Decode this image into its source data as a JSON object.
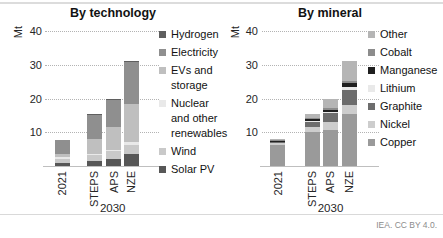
{
  "figure": {
    "attribution": "IEA. CC BY 4.0."
  },
  "chart_data": [
    {
      "type": "bar",
      "stacked": true,
      "title": "By technology",
      "ylabel": "Mt",
      "categories": [
        "2021",
        "STEPS",
        "APS",
        "NZE"
      ],
      "group_label": "2030",
      "ylim": [
        0,
        40
      ],
      "yticks": [
        10,
        20,
        30,
        40
      ],
      "grid": "horizontal-dotted",
      "legend_position": "right",
      "legend_order_top_to_bottom": [
        "Hydrogen",
        "Electricity",
        "EVs and storage",
        "Nuclear and other renewables",
        "Wind",
        "Solar PV"
      ],
      "series": [
        {
          "name": "Solar PV",
          "color": "#575757",
          "values": [
            1.0,
            1.6,
            2.0,
            3.5
          ]
        },
        {
          "name": "Wind",
          "color": "#c9c9c9",
          "values": [
            1.2,
            1.6,
            2.3,
            2.8
          ]
        },
        {
          "name": "Nuclear and other renewables",
          "color": "#e9e9e9",
          "values": [
            0.4,
            0.5,
            0.5,
            0.7
          ]
        },
        {
          "name": "EVs and storage",
          "color": "#bfbfbf",
          "values": [
            1.0,
            4.3,
            6.7,
            11.5
          ]
        },
        {
          "name": "Electricity",
          "color": "#8f8f8f",
          "values": [
            4.2,
            7.4,
            8.3,
            12.2
          ]
        },
        {
          "name": "Hydrogen",
          "color": "#5f5f5f",
          "values": [
            0.0,
            0.1,
            0.2,
            0.3
          ]
        }
      ],
      "totals": [
        7.8,
        15.5,
        20.0,
        31.0
      ]
    },
    {
      "type": "bar",
      "stacked": true,
      "title": "By mineral",
      "ylabel": "Mt",
      "categories": [
        "2021",
        "STEPS",
        "APS",
        "NZE"
      ],
      "group_label": "2030",
      "ylim": [
        0,
        40
      ],
      "yticks": [
        10,
        20,
        30,
        40
      ],
      "grid": "horizontal-dotted",
      "legend_position": "right",
      "legend_order_top_to_bottom": [
        "Other",
        "Cobalt",
        "Manganese",
        "Lithium",
        "Graphite",
        "Nickel",
        "Copper"
      ],
      "series": [
        {
          "name": "Copper",
          "color": "#9a9a9a",
          "values": [
            6.2,
            10.0,
            10.8,
            15.5
          ]
        },
        {
          "name": "Nickel",
          "color": "#cdcdcd",
          "values": [
            0.5,
            1.5,
            2.2,
            2.5
          ]
        },
        {
          "name": "Graphite",
          "color": "#6d6d6d",
          "values": [
            0.5,
            1.6,
            2.7,
            4.5
          ]
        },
        {
          "name": "Lithium",
          "color": "#e9e9e9",
          "values": [
            0.15,
            0.3,
            0.4,
            1.0
          ]
        },
        {
          "name": "Manganese",
          "color": "#1f1f1f",
          "values": [
            0.1,
            0.4,
            0.6,
            1.0
          ]
        },
        {
          "name": "Cobalt",
          "color": "#8c8c8c",
          "values": [
            0.15,
            0.4,
            0.5,
            0.8
          ]
        },
        {
          "name": "Other",
          "color": "#b5b5b5",
          "values": [
            0.3,
            1.3,
            2.7,
            5.7
          ]
        }
      ],
      "totals": [
        7.9,
        15.5,
        19.9,
        31.0
      ]
    }
  ]
}
